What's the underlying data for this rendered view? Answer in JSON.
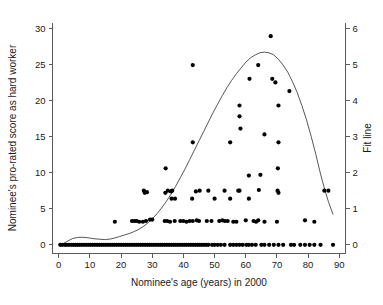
{
  "figure": {
    "width": 383,
    "height": 305,
    "background": "#ffffff"
  },
  "chart_data": {
    "type": "scatter",
    "title": "",
    "xlabel": "Nominee's age (years) in 2000",
    "ylabel": "Nominee's pro-rated score as hard worker",
    "y2label": "Fit line",
    "xlim": [
      -2,
      92
    ],
    "ylim": [
      -1.2,
      30.8
    ],
    "y2lim": [
      -0.24,
      6.16
    ],
    "xticks": [
      0,
      10,
      20,
      30,
      40,
      50,
      60,
      70,
      80,
      90
    ],
    "xticklabels": [
      "0",
      "10",
      "20",
      "30",
      "40",
      "50",
      "60",
      "70",
      "80",
      "90"
    ],
    "yticks": [
      0,
      5,
      10,
      15,
      20,
      25,
      30
    ],
    "yticklabels": [
      "0",
      "5",
      "10",
      "15",
      "20",
      "25",
      "30"
    ],
    "y2ticks": [
      0,
      1,
      2,
      3,
      4,
      5,
      6
    ],
    "y2ticklabels": [
      "0",
      "1",
      "2",
      "3",
      "4",
      "5",
      "6"
    ],
    "grid": false,
    "legend": false,
    "marker_color": "#000000",
    "marker_size": 2.1,
    "fit_line_color": "#444444",
    "points": [
      [
        0.5,
        0
      ],
      [
        1.2,
        0
      ],
      [
        2.0,
        0
      ],
      [
        2.6,
        0
      ],
      [
        3.3,
        0
      ],
      [
        4.0,
        0
      ],
      [
        4.7,
        0
      ],
      [
        5.4,
        0
      ],
      [
        6.0,
        0
      ],
      [
        6.7,
        0
      ],
      [
        7.4,
        0
      ],
      [
        8.1,
        0
      ],
      [
        8.8,
        0
      ],
      [
        9.5,
        0
      ],
      [
        10.2,
        0
      ],
      [
        10.9,
        0
      ],
      [
        11.6,
        0
      ],
      [
        12.3,
        0
      ],
      [
        13.0,
        0
      ],
      [
        13.7,
        0
      ],
      [
        14.4,
        0
      ],
      [
        15.1,
        0
      ],
      [
        15.8,
        0
      ],
      [
        16.5,
        0
      ],
      [
        17.2,
        0
      ],
      [
        17.9,
        0
      ],
      [
        18.6,
        0
      ],
      [
        19.3,
        0
      ],
      [
        20.0,
        0
      ],
      [
        20.7,
        0
      ],
      [
        21.4,
        0
      ],
      [
        22.1,
        0
      ],
      [
        22.8,
        0
      ],
      [
        23.5,
        0
      ],
      [
        24.2,
        0
      ],
      [
        24.9,
        0
      ],
      [
        25.6,
        0
      ],
      [
        26.3,
        0
      ],
      [
        27.0,
        0
      ],
      [
        27.7,
        0
      ],
      [
        28.4,
        0
      ],
      [
        29.1,
        0
      ],
      [
        29.8,
        0
      ],
      [
        30.5,
        0
      ],
      [
        31.2,
        0
      ],
      [
        31.9,
        0
      ],
      [
        32.6,
        0
      ],
      [
        33.3,
        0
      ],
      [
        34.0,
        0
      ],
      [
        34.7,
        0
      ],
      [
        35.4,
        0
      ],
      [
        36.1,
        0
      ],
      [
        36.8,
        0
      ],
      [
        37.5,
        0
      ],
      [
        38.2,
        0
      ],
      [
        38.9,
        0
      ],
      [
        39.6,
        0
      ],
      [
        40.3,
        0
      ],
      [
        41.0,
        0
      ],
      [
        41.7,
        0
      ],
      [
        42.4,
        0
      ],
      [
        43.1,
        0
      ],
      [
        43.8,
        0
      ],
      [
        44.5,
        0
      ],
      [
        45.2,
        0
      ],
      [
        45.9,
        0
      ],
      [
        46.6,
        0
      ],
      [
        47.3,
        0
      ],
      [
        48.0,
        0
      ],
      [
        49.2,
        0
      ],
      [
        50.0,
        0
      ],
      [
        51.0,
        0
      ],
      [
        52.0,
        0
      ],
      [
        53.2,
        0
      ],
      [
        55.0,
        0
      ],
      [
        56.0,
        0
      ],
      [
        57.0,
        0
      ],
      [
        58.0,
        0
      ],
      [
        59.0,
        0
      ],
      [
        60.2,
        0
      ],
      [
        61.0,
        0
      ],
      [
        62.0,
        0
      ],
      [
        63.2,
        0
      ],
      [
        65.0,
        0
      ],
      [
        66.0,
        0
      ],
      [
        67.5,
        0
      ],
      [
        69.0,
        0
      ],
      [
        70.5,
        0
      ],
      [
        72.0,
        0
      ],
      [
        74.5,
        0
      ],
      [
        75.5,
        0
      ],
      [
        77.5,
        0
      ],
      [
        79.0,
        0
      ],
      [
        80.5,
        0
      ],
      [
        82.0,
        0
      ],
      [
        84.0,
        0
      ],
      [
        88.0,
        0
      ],
      [
        18.0,
        3.2
      ],
      [
        23.5,
        3.3
      ],
      [
        24.3,
        3.3
      ],
      [
        25.0,
        3.3
      ],
      [
        25.8,
        3.2
      ],
      [
        27.0,
        3.2
      ],
      [
        28.0,
        3.3
      ],
      [
        29.3,
        3.5
      ],
      [
        30.0,
        3.5
      ],
      [
        34.0,
        3.3
      ],
      [
        34.8,
        3.3
      ],
      [
        35.7,
        3.2
      ],
      [
        37.2,
        3.3
      ],
      [
        39.0,
        3.3
      ],
      [
        40.0,
        3.3
      ],
      [
        41.0,
        3.2
      ],
      [
        42.0,
        3.3
      ],
      [
        43.0,
        3.3
      ],
      [
        44.3,
        3.4
      ],
      [
        45.0,
        3.3
      ],
      [
        47.5,
        3.3
      ],
      [
        49.0,
        3.3
      ],
      [
        51.5,
        3.3
      ],
      [
        52.5,
        3.4
      ],
      [
        53.3,
        3.3
      ],
      [
        54.2,
        3.3
      ],
      [
        56.0,
        3.2
      ],
      [
        57.0,
        3.2
      ],
      [
        60.0,
        3.4
      ],
      [
        62.5,
        3.3
      ],
      [
        63.3,
        3.2
      ],
      [
        64.0,
        3.4
      ],
      [
        66.0,
        3.2
      ],
      [
        70.0,
        3.2
      ],
      [
        79.0,
        3.4
      ],
      [
        82.0,
        3.2
      ],
      [
        27.3,
        7.5
      ],
      [
        27.6,
        7.2
      ],
      [
        28.3,
        7.3
      ],
      [
        34.2,
        7.2
      ],
      [
        35.0,
        7.5
      ],
      [
        36.0,
        7.4
      ],
      [
        36.4,
        7.5
      ],
      [
        36.2,
        6.4
      ],
      [
        37.3,
        6.4
      ],
      [
        42.8,
        6.4
      ],
      [
        44.0,
        7.4
      ],
      [
        45.2,
        7.5
      ],
      [
        48.0,
        7.5
      ],
      [
        50.0,
        6.4
      ],
      [
        53.2,
        7.5
      ],
      [
        55.0,
        6.4
      ],
      [
        57.6,
        7.5
      ],
      [
        58.0,
        7.5
      ],
      [
        61.0,
        6.4
      ],
      [
        64.2,
        7.6
      ],
      [
        70.2,
        7.5
      ],
      [
        70.5,
        7.2
      ],
      [
        85.2,
        7.5
      ],
      [
        86.5,
        7.5
      ],
      [
        34.3,
        10.6
      ],
      [
        61.0,
        9.6
      ],
      [
        64.7,
        9.7
      ],
      [
        70.3,
        10.6
      ],
      [
        43.0,
        14.2
      ],
      [
        55.0,
        14.2
      ],
      [
        66.0,
        15.3
      ],
      [
        70.5,
        14.2
      ],
      [
        58.3,
        16.1
      ],
      [
        58.0,
        17.8
      ],
      [
        58.0,
        19.3
      ],
      [
        70.5,
        19.3
      ],
      [
        61.2,
        23.0
      ],
      [
        68.5,
        23.0
      ],
      [
        69.5,
        22.5
      ],
      [
        74.0,
        21.3
      ],
      [
        43.0,
        24.9
      ],
      [
        64.0,
        24.9
      ],
      [
        68.0,
        28.9
      ]
    ],
    "fit_line": [
      [
        0.0,
        0.0
      ],
      [
        1.5,
        0.18
      ],
      [
        3.0,
        0.55
      ],
      [
        4.5,
        0.88
      ],
      [
        6.0,
        1.02
      ],
      [
        7.5,
        1.05
      ],
      [
        9.0,
        1.0
      ],
      [
        10.5,
        0.9
      ],
      [
        12.0,
        0.82
      ],
      [
        13.5,
        0.76
      ],
      [
        15.0,
        0.74
      ],
      [
        16.5,
        0.8
      ],
      [
        18.0,
        0.95
      ],
      [
        19.5,
        1.15
      ],
      [
        21.0,
        1.35
      ],
      [
        22.5,
        1.55
      ],
      [
        24.0,
        1.8
      ],
      [
        25.5,
        2.1
      ],
      [
        27.0,
        2.5
      ],
      [
        28.5,
        3.0
      ],
      [
        30.0,
        3.6
      ],
      [
        31.5,
        4.3
      ],
      [
        33.0,
        5.1
      ],
      [
        34.5,
        6.0
      ],
      [
        36.0,
        7.0
      ],
      [
        37.5,
        8.1
      ],
      [
        39.0,
        9.3
      ],
      [
        40.5,
        10.5
      ],
      [
        42.0,
        11.8
      ],
      [
        43.5,
        13.1
      ],
      [
        45.0,
        14.4
      ],
      [
        46.5,
        15.7
      ],
      [
        48.0,
        17.0
      ],
      [
        49.5,
        18.3
      ],
      [
        51.0,
        19.5
      ],
      [
        52.5,
        20.7
      ],
      [
        54.0,
        21.8
      ],
      [
        55.5,
        22.8
      ],
      [
        57.0,
        23.7
      ],
      [
        58.5,
        24.5
      ],
      [
        60.0,
        25.3
      ],
      [
        61.5,
        25.9
      ],
      [
        63.0,
        26.3
      ],
      [
        64.5,
        26.6
      ],
      [
        66.0,
        26.7
      ],
      [
        67.5,
        26.6
      ],
      [
        69.0,
        26.3
      ],
      [
        70.5,
        25.7
      ],
      [
        72.0,
        24.9
      ],
      [
        73.5,
        23.9
      ],
      [
        75.0,
        22.6
      ],
      [
        76.5,
        21.1
      ],
      [
        78.0,
        19.3
      ],
      [
        79.5,
        17.3
      ],
      [
        81.0,
        15.0
      ],
      [
        82.5,
        12.5
      ],
      [
        84.0,
        9.8
      ],
      [
        85.5,
        7.4
      ],
      [
        86.5,
        6.0
      ],
      [
        87.5,
        4.8
      ],
      [
        88.0,
        4.2
      ]
    ]
  }
}
